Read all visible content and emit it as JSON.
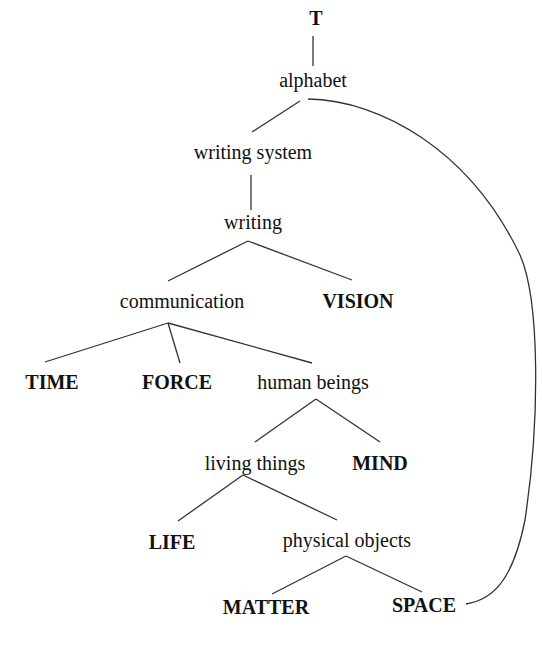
{
  "diagram": {
    "type": "tree",
    "nodes": [
      {
        "id": "T",
        "label": "T",
        "bold": true,
        "x": 316,
        "y": 18
      },
      {
        "id": "alphabet",
        "label": "alphabet",
        "bold": false,
        "x": 313,
        "y": 80
      },
      {
        "id": "writing_system",
        "label": "writing system",
        "bold": false,
        "x": 253,
        "y": 152
      },
      {
        "id": "writing",
        "label": "writing",
        "bold": false,
        "x": 253,
        "y": 222
      },
      {
        "id": "communication",
        "label": "communication",
        "bold": false,
        "x": 182,
        "y": 301
      },
      {
        "id": "vision",
        "label": "VISION",
        "bold": true,
        "x": 358,
        "y": 301
      },
      {
        "id": "time",
        "label": "TIME",
        "bold": true,
        "x": 52,
        "y": 382
      },
      {
        "id": "force",
        "label": "FORCE",
        "bold": true,
        "x": 177,
        "y": 382
      },
      {
        "id": "human_beings",
        "label": "human beings",
        "bold": false,
        "x": 313,
        "y": 382
      },
      {
        "id": "living_things",
        "label": "living things",
        "bold": false,
        "x": 255,
        "y": 463
      },
      {
        "id": "mind",
        "label": "MIND",
        "bold": true,
        "x": 380,
        "y": 463
      },
      {
        "id": "life",
        "label": "LIFE",
        "bold": true,
        "x": 172,
        "y": 542
      },
      {
        "id": "physical_objects",
        "label": "physical objects",
        "bold": false,
        "x": 347,
        "y": 540
      },
      {
        "id": "matter",
        "label": "MATTER",
        "bold": true,
        "x": 266,
        "y": 607
      },
      {
        "id": "space",
        "label": "SPACE",
        "bold": true,
        "x": 424,
        "y": 605
      }
    ],
    "edges": [
      {
        "from": "T",
        "to": "alphabet",
        "x1": 313,
        "y1": 36,
        "x2": 313,
        "y2": 66
      },
      {
        "from": "alphabet",
        "to": "writing_system",
        "x1": 300,
        "y1": 101,
        "x2": 252,
        "y2": 132
      },
      {
        "from": "writing_system",
        "to": "writing",
        "x1": 251,
        "y1": 175,
        "x2": 251,
        "y2": 210
      },
      {
        "from": "writing",
        "to": "communication",
        "x1": 248,
        "y1": 241,
        "x2": 168,
        "y2": 281
      },
      {
        "from": "writing",
        "to": "vision",
        "x1": 248,
        "y1": 241,
        "x2": 352,
        "y2": 280
      },
      {
        "from": "communication",
        "to": "time",
        "x1": 168,
        "y1": 323,
        "x2": 45,
        "y2": 362
      },
      {
        "from": "communication",
        "to": "force",
        "x1": 168,
        "y1": 323,
        "x2": 180,
        "y2": 363
      },
      {
        "from": "communication",
        "to": "human_beings",
        "x1": 168,
        "y1": 323,
        "x2": 312,
        "y2": 363
      },
      {
        "from": "human_beings",
        "to": "living_things",
        "x1": 316,
        "y1": 399,
        "x2": 255,
        "y2": 442
      },
      {
        "from": "human_beings",
        "to": "mind",
        "x1": 316,
        "y1": 399,
        "x2": 380,
        "y2": 442
      },
      {
        "from": "living_things",
        "to": "life",
        "x1": 243,
        "y1": 475,
        "x2": 178,
        "y2": 521
      },
      {
        "from": "living_things",
        "to": "physical_objects",
        "x1": 243,
        "y1": 475,
        "x2": 337,
        "y2": 520
      },
      {
        "from": "physical_objects",
        "to": "matter",
        "x1": 346,
        "y1": 556,
        "x2": 272,
        "y2": 594
      },
      {
        "from": "physical_objects",
        "to": "space",
        "x1": 346,
        "y1": 556,
        "x2": 422,
        "y2": 592
      }
    ],
    "curve": {
      "from": "alphabet",
      "to": "space",
      "path": "M 308 99 C 380 100, 470 150, 520 255 C 540 300, 540 420, 525 520 C 512 585, 490 600, 466 604"
    },
    "colors": {
      "text": "#111111",
      "stroke": "#333333",
      "background": "#ffffff"
    }
  }
}
